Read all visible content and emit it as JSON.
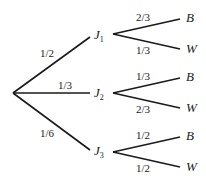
{
  "diagram": {
    "type": "probability-tree",
    "root_branches": [
      {
        "node": "J",
        "subscript": "1",
        "probability": "1/2",
        "children": [
          {
            "outcome": "B",
            "probability": "2/3"
          },
          {
            "outcome": "W",
            "probability": "1/3"
          }
        ]
      },
      {
        "node": "J",
        "subscript": "2",
        "probability": "1/3",
        "children": [
          {
            "outcome": "B",
            "probability": "1/3"
          },
          {
            "outcome": "W",
            "probability": "2/3"
          }
        ]
      },
      {
        "node": "J",
        "subscript": "3",
        "probability": "1/6",
        "children": [
          {
            "outcome": "B",
            "probability": "1/2"
          },
          {
            "outcome": "W",
            "probability": "1/2"
          }
        ]
      }
    ]
  }
}
